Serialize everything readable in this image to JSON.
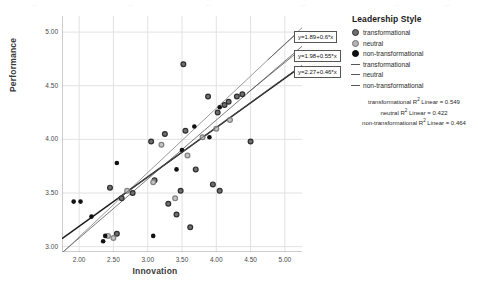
{
  "chart_data": {
    "type": "scatter",
    "title": "",
    "xlabel": "Innovation",
    "ylabel": "Performance",
    "xlim": [
      1.75,
      5.25
    ],
    "ylim": [
      2.95,
      5.15
    ],
    "xticks": [
      "2.00",
      "2.50",
      "3.00",
      "3.50",
      "4.00",
      "4.50",
      "5.00"
    ],
    "yticks": [
      "3.00",
      "3.50",
      "4.00",
      "4.50",
      "5.00"
    ],
    "xtick_values": [
      2.0,
      2.5,
      3.0,
      3.5,
      4.0,
      4.5,
      5.0
    ],
    "ytick_values": [
      3.0,
      3.5,
      4.0,
      4.5,
      5.0
    ],
    "grid": true,
    "legend_position": "right",
    "series": [
      {
        "name": "transformational",
        "marker": "dark-gray-ring",
        "color": "#6f6f6f",
        "points": [
          [
            2.45,
            3.55
          ],
          [
            2.55,
            3.12
          ],
          [
            2.62,
            3.45
          ],
          [
            2.78,
            3.5
          ],
          [
            3.05,
            3.98
          ],
          [
            3.1,
            3.62
          ],
          [
            3.25,
            4.05
          ],
          [
            3.3,
            3.4
          ],
          [
            3.42,
            3.3
          ],
          [
            3.48,
            3.52
          ],
          [
            3.52,
            4.7
          ],
          [
            3.55,
            4.08
          ],
          [
            3.62,
            3.18
          ],
          [
            3.7,
            3.72
          ],
          [
            3.88,
            4.4
          ],
          [
            3.95,
            3.58
          ],
          [
            4.02,
            4.25
          ],
          [
            4.05,
            3.52
          ],
          [
            4.12,
            4.32
          ],
          [
            4.18,
            4.35
          ],
          [
            4.3,
            4.4
          ],
          [
            4.38,
            4.42
          ],
          [
            4.5,
            3.98
          ]
        ]
      },
      {
        "name": "neutral",
        "marker": "light-gray-ring",
        "color": "#b4b4b4",
        "points": [
          [
            2.42,
            3.1
          ],
          [
            2.5,
            3.08
          ],
          [
            2.7,
            3.52
          ],
          [
            3.08,
            3.6
          ],
          [
            3.2,
            3.95
          ],
          [
            3.4,
            3.45
          ],
          [
            3.58,
            3.85
          ],
          [
            3.8,
            4.02
          ],
          [
            4.0,
            4.1
          ],
          [
            4.2,
            4.18
          ]
        ]
      },
      {
        "name": "non-transformational",
        "marker": "solid-black",
        "color": "#111111",
        "points": [
          [
            1.92,
            3.42
          ],
          [
            2.02,
            3.42
          ],
          [
            2.18,
            3.28
          ],
          [
            2.35,
            3.05
          ],
          [
            2.38,
            3.1
          ],
          [
            2.55,
            3.78
          ],
          [
            3.08,
            3.1
          ],
          [
            3.42,
            3.72
          ],
          [
            3.5,
            3.9
          ],
          [
            3.68,
            4.12
          ],
          [
            3.9,
            4.02
          ],
          [
            4.05,
            4.3
          ]
        ]
      }
    ],
    "fit_lines": [
      {
        "name": "transformational",
        "intercept": 1.89,
        "slope": 0.6,
        "equation": "y=1.89+0.6*x",
        "r_squared": 0.549,
        "color": "#9a9a9a"
      },
      {
        "name": "neutral",
        "intercept": 1.98,
        "slope": 0.55,
        "equation": "y=1.98+0.55*x",
        "r_squared": 0.422,
        "color": "#7a7a7a"
      },
      {
        "name": "non-transformational",
        "intercept": 2.27,
        "slope": 0.46,
        "equation": "y=2.27+0.46*x",
        "r_squared": 0.464,
        "color": "#1a1a1a"
      }
    ]
  },
  "legend": {
    "title": "Leadership Style",
    "marker_items": [
      {
        "label": "transformational",
        "marker": "dark-gray-ring"
      },
      {
        "label": "neutral",
        "marker": "light-gray-ring"
      },
      {
        "label": "non-transformational",
        "marker": "solid-black"
      }
    ],
    "line_items": [
      {
        "label": "transformational"
      },
      {
        "label": "neutral"
      },
      {
        "label": "non-transformational"
      }
    ]
  },
  "rsquared_notes": [
    {
      "prefix": "transformational",
      "sup": "2",
      "mid": " Linear = ",
      "value": "0.549"
    },
    {
      "prefix": "neutral",
      "sup": "2",
      "mid": " Linear = ",
      "value": "0.422"
    },
    {
      "prefix": "non-transformational",
      "sup": "2",
      "mid": " Linear = ",
      "value": "0.464"
    }
  ],
  "equation_boxes": [
    {
      "text": "y=1.89+0.6*x"
    },
    {
      "text": "y=1.98+0.55*x"
    },
    {
      "text": "y=2.27+0.46*x"
    }
  ],
  "ghost_text": [
    {
      "t": "··",
      "x": 32
    },
    {
      "t": "··",
      "x": 128
    },
    {
      "t": "··",
      "x": 206
    },
    {
      "t": "··",
      "x": 300
    },
    {
      "t": "··",
      "x": 394
    },
    {
      "t": "··",
      "x": 444
    }
  ]
}
